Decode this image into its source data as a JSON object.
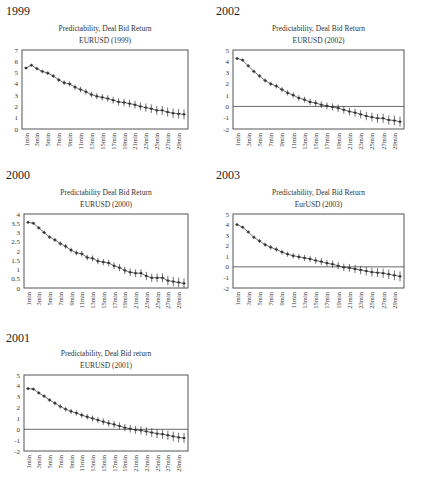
{
  "chart_data": [
    {
      "panel_label": "1999",
      "type": "line",
      "title": "Predictability, Deal Bid Return",
      "subtitle": "EURUSD (1999)",
      "xlabel": "",
      "ylabel": "",
      "ylim": [
        0,
        7
      ],
      "yticks": [
        "0",
        "1",
        "2",
        "3",
        "4",
        "5",
        "6",
        "7"
      ],
      "ytick_values": [
        0,
        1,
        2,
        3,
        4,
        5,
        6,
        7
      ],
      "zero_line": false,
      "x": [
        "1min",
        "2min",
        "3min",
        "4min",
        "5min",
        "6min",
        "7min",
        "8min",
        "9min",
        "10min",
        "11min",
        "12min",
        "13min",
        "14min",
        "15min",
        "16min",
        "17min",
        "18min",
        "19min",
        "20min",
        "21min",
        "22min",
        "23min",
        "24min",
        "25min",
        "26min",
        "27min",
        "28min",
        "29min",
        "30min"
      ],
      "xtick_labels": [
        "1min",
        "3min",
        "5min",
        "7min",
        "9min",
        "11min",
        "13min",
        "15min",
        "17min",
        "19min",
        "21min",
        "23min",
        "25min",
        "27min",
        "29min"
      ],
      "values": [
        5.4,
        5.65,
        5.35,
        5.1,
        4.95,
        4.7,
        4.35,
        4.1,
        4.0,
        3.7,
        3.5,
        3.3,
        3.05,
        2.9,
        2.8,
        2.7,
        2.55,
        2.4,
        2.35,
        2.25,
        2.15,
        2.0,
        1.9,
        1.8,
        1.65,
        1.65,
        1.5,
        1.4,
        1.35,
        1.3
      ],
      "error_bars": true
    },
    {
      "panel_label": "2002",
      "type": "line",
      "title": "Predictability, Deal Bid Return",
      "subtitle": "EURUSD (2002)",
      "xlabel": "",
      "ylabel": "",
      "ylim": [
        -2,
        5
      ],
      "yticks": [
        "-2",
        "-1",
        "0",
        "1",
        "2",
        "3",
        "4",
        "5"
      ],
      "ytick_values": [
        -2,
        -1,
        0,
        1,
        2,
        3,
        4,
        5
      ],
      "zero_line": true,
      "x": [
        "1min",
        "2min",
        "3min",
        "4min",
        "5min",
        "6min",
        "7min",
        "8min",
        "9min",
        "10min",
        "11min",
        "12min",
        "13min",
        "14min",
        "15min",
        "16min",
        "17min",
        "18min",
        "19min",
        "20min",
        "21min",
        "22min",
        "23min",
        "24min",
        "25min",
        "26min",
        "27min",
        "28min",
        "29min",
        "30min"
      ],
      "xtick_labels": [
        "1min",
        "3min",
        "5min",
        "7min",
        "9min",
        "11min",
        "13min",
        "15min",
        "17min",
        "19min",
        "21min",
        "23min",
        "25min",
        "27min",
        "29min"
      ],
      "values": [
        4.25,
        4.1,
        3.6,
        3.1,
        2.7,
        2.3,
        2.0,
        1.8,
        1.5,
        1.2,
        1.0,
        0.75,
        0.6,
        0.4,
        0.3,
        0.15,
        0.05,
        -0.05,
        -0.15,
        -0.3,
        -0.45,
        -0.55,
        -0.7,
        -0.85,
        -0.95,
        -1.05,
        -1.05,
        -1.2,
        -1.25,
        -1.35
      ],
      "error_bars": true
    },
    {
      "panel_label": "2000",
      "type": "line",
      "title": "Predictability Deal Bid Return",
      "subtitle": "EURUSD (2000)",
      "xlabel": "",
      "ylabel": "",
      "ylim": [
        0,
        4
      ],
      "yticks": [
        "0",
        "0.5",
        "1",
        "1.5",
        "2",
        "2.5",
        "3",
        "3.5",
        "4"
      ],
      "ytick_values": [
        0,
        0.5,
        1,
        1.5,
        2,
        2.5,
        3,
        3.5,
        4
      ],
      "zero_line": false,
      "x": [
        "1min",
        "2min",
        "3min",
        "4min",
        "5min",
        "6min",
        "7min",
        "8min",
        "9min",
        "10min",
        "11min",
        "12min",
        "13min",
        "14min",
        "15min",
        "16min",
        "17min",
        "18min",
        "19min",
        "20min",
        "21min",
        "22min",
        "23min",
        "24min",
        "25min",
        "26min",
        "27min",
        "28min",
        "29min",
        "30min"
      ],
      "xtick_labels": [
        "1min",
        "3min",
        "5min",
        "7min",
        "9min",
        "11min",
        "13min",
        "15min",
        "17min",
        "19min",
        "21min",
        "23min",
        "25min",
        "27min",
        "29min"
      ],
      "values": [
        3.55,
        3.5,
        3.25,
        3.0,
        2.75,
        2.6,
        2.4,
        2.25,
        2.05,
        1.9,
        1.85,
        1.65,
        1.6,
        1.45,
        1.4,
        1.35,
        1.2,
        1.1,
        0.95,
        0.85,
        0.8,
        0.8,
        0.65,
        0.55,
        0.55,
        0.55,
        0.4,
        0.35,
        0.3,
        0.25,
        0.2
      ],
      "error_bars": true
    },
    {
      "panel_label": "2003",
      "type": "line",
      "title": "Predictability, Deal Bid Return",
      "subtitle": "EurUSD (2003)",
      "xlabel": "",
      "ylabel": "",
      "ylim": [
        -2,
        5
      ],
      "yticks": [
        "-2",
        "-1",
        "0",
        "1",
        "2",
        "3",
        "4",
        "5"
      ],
      "ytick_values": [
        -2,
        -1,
        0,
        1,
        2,
        3,
        4,
        5
      ],
      "zero_line": true,
      "x": [
        "1min",
        "2min",
        "3min",
        "4min",
        "5min",
        "6min",
        "7min",
        "8min",
        "9min",
        "10min",
        "11min",
        "12min",
        "13min",
        "14min",
        "15min",
        "16min",
        "17min",
        "18min",
        "19min",
        "20min",
        "21min",
        "22min",
        "23min",
        "24min",
        "25min",
        "26min",
        "27min",
        "28min",
        "29min",
        "30min"
      ],
      "xtick_labels": [
        "1min",
        "3min",
        "5min",
        "7min",
        "9min",
        "11min",
        "13min",
        "15min",
        "17min",
        "19min",
        "21min",
        "23min",
        "25min",
        "27min",
        "29min"
      ],
      "values": [
        4.0,
        3.75,
        3.3,
        2.8,
        2.45,
        2.1,
        1.85,
        1.65,
        1.4,
        1.2,
        1.05,
        0.95,
        0.85,
        0.75,
        0.6,
        0.5,
        0.35,
        0.25,
        0.1,
        -0.05,
        -0.1,
        -0.2,
        -0.3,
        -0.4,
        -0.5,
        -0.55,
        -0.6,
        -0.7,
        -0.8,
        -0.9,
        -0.95
      ],
      "error_bars": true
    },
    {
      "panel_label": "2001",
      "type": "line",
      "title": "Predictability, Deal Bid return",
      "subtitle": "EURUSD (2001)",
      "xlabel": "",
      "ylabel": "",
      "ylim": [
        -2,
        5
      ],
      "yticks": [
        "-2",
        "-1",
        "0",
        "1",
        "2",
        "3",
        "4",
        "5"
      ],
      "ytick_values": [
        -2,
        -1,
        0,
        1,
        2,
        3,
        4,
        5
      ],
      "zero_line": true,
      "x": [
        "1min",
        "2min",
        "3min",
        "4min",
        "5min",
        "6min",
        "7min",
        "8min",
        "9min",
        "10min",
        "11min",
        "12min",
        "13min",
        "14min",
        "15min",
        "16min",
        "17min",
        "18min",
        "19min",
        "20min",
        "21min",
        "22min",
        "23min",
        "24min",
        "25min",
        "26min",
        "27min",
        "28min",
        "29min",
        "30min"
      ],
      "xtick_labels": [
        "1min",
        "3min",
        "5min",
        "7min",
        "9min",
        "11min",
        "13min",
        "15min",
        "17min",
        "19min",
        "21min",
        "23min",
        "25min",
        "27min",
        "29min"
      ],
      "values": [
        3.75,
        3.7,
        3.35,
        3.05,
        2.7,
        2.4,
        2.1,
        1.85,
        1.65,
        1.5,
        1.3,
        1.15,
        1.0,
        0.85,
        0.7,
        0.55,
        0.45,
        0.3,
        0.15,
        0.05,
        -0.05,
        -0.1,
        -0.2,
        -0.3,
        -0.4,
        -0.45,
        -0.55,
        -0.65,
        -0.75,
        -0.8,
        -0.9
      ],
      "error_bars": true
    }
  ],
  "panels": [
    {
      "label": "1999"
    },
    {
      "label": "2002"
    },
    {
      "label": "2000"
    },
    {
      "label": "2003"
    },
    {
      "label": "2001"
    }
  ],
  "colors": {
    "line": "#333333",
    "axis": "#555555",
    "zero_line": "#444444",
    "text": "#222222"
  }
}
